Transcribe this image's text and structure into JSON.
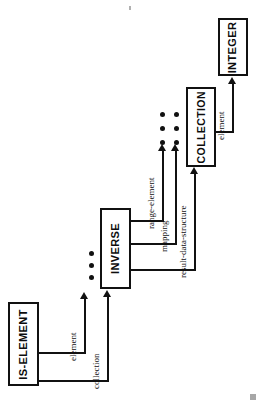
{
  "diagram": {
    "orientation": "rotated-90-ccw",
    "background_color": "#ffffff",
    "ink_color": "#111111",
    "nodes": [
      {
        "id": "is-element",
        "label": "IS-ELEMENT"
      },
      {
        "id": "inverse",
        "label": "INVERSE"
      },
      {
        "id": "collection",
        "label": "COLLECTION"
      },
      {
        "id": "integer",
        "label": "INTEGER"
      }
    ],
    "edges": [
      {
        "id": "e1",
        "label": "element",
        "from": "is-element",
        "to": "inverse"
      },
      {
        "id": "e2",
        "label": "collection",
        "from": "is-element",
        "to": "inverse"
      },
      {
        "id": "e3",
        "label": "range-element",
        "from": "inverse",
        "to": "collection"
      },
      {
        "id": "e4",
        "label": "mapping",
        "from": "inverse",
        "to": "collection"
      },
      {
        "id": "e5",
        "label": "result-data-structure",
        "from": "inverse",
        "to": "collection"
      },
      {
        "id": "e6",
        "label": "element",
        "from": "collection",
        "to": "integer"
      }
    ],
    "ellipsis": [
      {
        "id": "inverse-ellipsis",
        "count": 3,
        "arrangement": "1x3"
      },
      {
        "id": "collection-ellipsis",
        "count": 6,
        "arrangement": "2x3"
      }
    ],
    "artifacts": [
      {
        "id": "scan-mark",
        "description": "page-corner scan speck"
      },
      {
        "id": "top-speck",
        "description": "top edge scan speck"
      }
    ]
  }
}
